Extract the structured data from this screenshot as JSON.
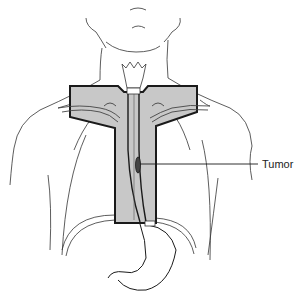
{
  "figure": {
    "type": "anatomical-diagram",
    "labels": {
      "tumor": "Tumor"
    },
    "colors": {
      "field_fill": "#c8c8c8",
      "field_outline": "#1a1a1a",
      "line_art": "#333333",
      "background": "#ffffff"
    }
  }
}
